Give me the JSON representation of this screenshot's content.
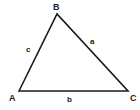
{
  "diagram": {
    "type": "triangle",
    "background_color": "#ffffff",
    "stroke_color": "#1a1a1a",
    "label_color": "#1a1a1a",
    "stroke_width": 1.6,
    "vertices": [
      {
        "id": "A",
        "label": "A",
        "x": 19,
        "y": 91
      },
      {
        "id": "B",
        "label": "B",
        "x": 57,
        "y": 14
      },
      {
        "id": "C",
        "label": "C",
        "x": 128,
        "y": 91
      }
    ],
    "sides": [
      {
        "id": "a",
        "label": "a",
        "from": "B",
        "to": "C",
        "opposite_vertex": "A",
        "label_x": 93,
        "label_y": 42
      },
      {
        "id": "b",
        "label": "b",
        "from": "A",
        "to": "C",
        "opposite_vertex": "B",
        "label_x": 70,
        "label_y": 100
      },
      {
        "id": "c",
        "label": "c",
        "from": "A",
        "to": "B",
        "opposite_vertex": "C",
        "label_x": 29,
        "label_y": 50
      }
    ],
    "polygon_points": "19,91 57,14 128,91"
  }
}
